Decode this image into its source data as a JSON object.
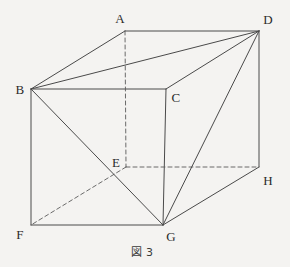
{
  "figure": {
    "caption": "図 3",
    "caption_position": {
      "x": 142,
      "y": 251
    },
    "shape": "rectangular-cuboid",
    "canvas": {
      "width": 290,
      "height": 267
    },
    "background_color": "#f4f3f1",
    "line_color": "#4a4a4a",
    "hidden_line_color": "#5a5a5a",
    "label_color": "#2b2b2b",
    "vertices": [
      {
        "name": "A",
        "x": 125,
        "y": 31,
        "label_x": 120,
        "label_y": 18,
        "hidden": false
      },
      {
        "name": "B",
        "x": 31,
        "y": 89,
        "label_x": 20,
        "label_y": 89,
        "hidden": false
      },
      {
        "name": "C",
        "x": 166,
        "y": 89,
        "label_x": 176,
        "label_y": 97,
        "hidden": false
      },
      {
        "name": "D",
        "x": 259,
        "y": 31,
        "label_x": 268,
        "label_y": 19,
        "hidden": false
      },
      {
        "name": "E",
        "x": 126,
        "y": 167,
        "label_x": 116,
        "label_y": 162,
        "hidden": true
      },
      {
        "name": "F",
        "x": 31,
        "y": 225,
        "label_x": 20,
        "label_y": 234,
        "hidden": false
      },
      {
        "name": "G",
        "x": 163,
        "y": 225,
        "label_x": 171,
        "label_y": 236,
        "hidden": false
      },
      {
        "name": "H",
        "x": 259,
        "y": 167,
        "label_x": 268,
        "label_y": 180,
        "hidden": false
      }
    ],
    "edges": [
      {
        "from": "A",
        "to": "D",
        "style": "solid",
        "kind": "edge"
      },
      {
        "from": "A",
        "to": "B",
        "style": "solid",
        "kind": "edge"
      },
      {
        "from": "B",
        "to": "C",
        "style": "solid",
        "kind": "edge"
      },
      {
        "from": "C",
        "to": "D",
        "style": "solid",
        "kind": "edge"
      },
      {
        "from": "B",
        "to": "F",
        "style": "solid",
        "kind": "edge"
      },
      {
        "from": "C",
        "to": "G",
        "style": "solid",
        "kind": "edge"
      },
      {
        "from": "D",
        "to": "H",
        "style": "solid",
        "kind": "edge"
      },
      {
        "from": "F",
        "to": "G",
        "style": "solid",
        "kind": "edge"
      },
      {
        "from": "G",
        "to": "H",
        "style": "solid",
        "kind": "edge"
      },
      {
        "from": "A",
        "to": "E",
        "style": "dashed",
        "kind": "hidden-edge"
      },
      {
        "from": "E",
        "to": "F",
        "style": "dashed",
        "kind": "hidden-edge"
      },
      {
        "from": "E",
        "to": "H",
        "style": "dashed",
        "kind": "hidden-edge"
      },
      {
        "from": "B",
        "to": "D",
        "style": "solid",
        "kind": "diagonal"
      },
      {
        "from": "B",
        "to": "G",
        "style": "solid",
        "kind": "diagonal"
      },
      {
        "from": "D",
        "to": "G",
        "style": "solid",
        "kind": "diagonal"
      }
    ]
  }
}
